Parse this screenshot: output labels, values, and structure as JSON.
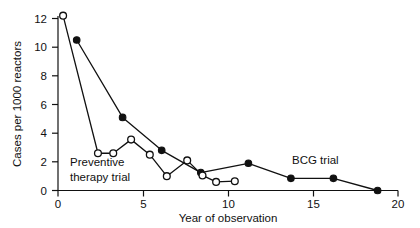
{
  "chart_data": {
    "type": "line",
    "title": "",
    "xlabel": "Year of observation",
    "ylabel": "Cases per 1000 reactors",
    "xlim": [
      0,
      20
    ],
    "ylim": [
      0,
      12.8
    ],
    "xticks": [
      0,
      5,
      10,
      15,
      20
    ],
    "yticks": [
      0,
      2,
      4,
      6,
      8,
      10,
      12
    ],
    "xtick_labels": [
      "0",
      "5",
      "10",
      "15",
      "20"
    ],
    "ytick_labels": [
      "0",
      "2",
      "4",
      "6",
      "8",
      "10",
      "12"
    ],
    "grid": false,
    "legend_position": "inline-annotation",
    "series": [
      {
        "name": "BCG trial",
        "marker": "filled-circle",
        "marker_label": "closed circles",
        "points": [
          {
            "x": 1.1,
            "y": 10.5
          },
          {
            "x": 3.8,
            "y": 5.1
          },
          {
            "x": 6.1,
            "y": 2.8
          },
          {
            "x": 8.4,
            "y": 1.25
          },
          {
            "x": 11.2,
            "y": 1.9
          },
          {
            "x": 13.7,
            "y": 0.85
          },
          {
            "x": 16.2,
            "y": 0.85
          },
          {
            "x": 18.8,
            "y": 0.0
          }
        ]
      },
      {
        "name": "Preventive therapy trial",
        "marker": "open-circle",
        "marker_label": "open circles",
        "points": [
          {
            "x": 0.3,
            "y": 12.2
          },
          {
            "x": 2.35,
            "y": 2.6
          },
          {
            "x": 3.25,
            "y": 2.6
          },
          {
            "x": 4.3,
            "y": 3.55
          },
          {
            "x": 5.4,
            "y": 2.5
          },
          {
            "x": 6.4,
            "y": 1.0
          },
          {
            "x": 7.6,
            "y": 2.1
          },
          {
            "x": 8.5,
            "y": 1.05
          },
          {
            "x": 9.3,
            "y": 0.6
          },
          {
            "x": 10.4,
            "y": 0.65
          }
        ]
      }
    ],
    "annotations": [
      {
        "text_line1": "Preventive",
        "text_line2": "therapy trial",
        "x": 2.2,
        "y": 2.0
      },
      {
        "text_line1": "BCG trial",
        "text_line2": "",
        "x": 14.0,
        "y": 1.75
      }
    ],
    "colors": {
      "line": "#111111",
      "filled_marker": "#111111",
      "open_marker_fill": "#ffffff",
      "axis": "#111111",
      "background": "#ffffff"
    }
  },
  "labels": {
    "ylabel": "Cases per 1000 reactors",
    "xlabel": "Year of observation",
    "annotation_preventive_line1": "Preventive",
    "annotation_preventive_line2": "therapy trial",
    "annotation_bcg": "BCG trial",
    "y_0": "0",
    "y_2": "2",
    "y_4": "4",
    "y_6": "6",
    "y_8": "8",
    "y_10": "10",
    "y_12": "12",
    "x_0": "0",
    "x_5": "5",
    "x_10": "10",
    "x_15": "15",
    "x_20": "20"
  }
}
